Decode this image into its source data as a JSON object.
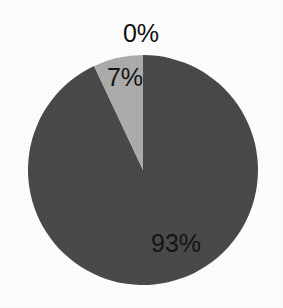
{
  "chart_data": {
    "type": "pie",
    "title": "",
    "subtitle": "",
    "xlabel": "",
    "ylabel": "",
    "grid": false,
    "legend": "none",
    "labels_shown": true,
    "label_format": "percent",
    "start_angle_deg": 0,
    "direction": "clockwise",
    "categories": [
      "93%",
      "7%",
      "0%"
    ],
    "values": [
      93,
      7,
      0
    ],
    "slices": [
      {
        "label": "93%",
        "value": 93,
        "color": "#4a4a4a",
        "start_angle_deg": 0,
        "end_angle_deg": 334.8,
        "label_position": "inside",
        "label_x": 176,
        "label_y": 243
      },
      {
        "label": "7%",
        "value": 7,
        "color": "#adadad",
        "start_angle_deg": 334.8,
        "end_angle_deg": 360,
        "label_position": "inside",
        "label_x": 125,
        "label_y": 77
      },
      {
        "label": "0%",
        "value": 0,
        "color": "#7f7f7f",
        "start_angle_deg": 360,
        "end_angle_deg": 360,
        "label_position": "outside-top",
        "label_x": 141,
        "label_y": 33
      }
    ],
    "geometry": {
      "center_x": 143,
      "center_y": 170,
      "radius": 115
    },
    "colors": {
      "background": "#ffffff",
      "slice_major": "#4a4a4a",
      "slice_minor": "#adadad",
      "label_text": "#141414"
    }
  }
}
